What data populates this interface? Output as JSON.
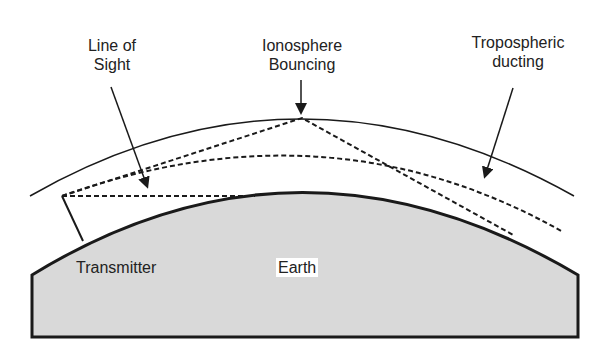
{
  "diagram": {
    "labels": {
      "line_of_sight": [
        "Line of",
        "Sight"
      ],
      "ionosphere": [
        "Ionosphere",
        "Bouncing"
      ],
      "tropospheric": [
        "Tropospheric",
        "ducting"
      ],
      "transmitter": "Transmitter",
      "earth": "Earth"
    },
    "colors": {
      "earth_fill": "#d9d9d9",
      "stroke": "#1a1a1a",
      "background": "#ffffff"
    }
  }
}
